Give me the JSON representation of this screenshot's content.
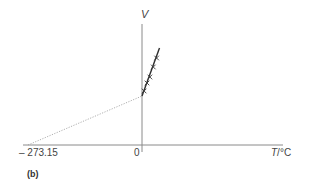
{
  "chart_data": {
    "type": "line",
    "title": "",
    "panel_label": "(b)",
    "xlabel": "T/°C",
    "xlabel_italic_part": "T",
    "xlabel_unit_part": "/°C",
    "ylabel": "V",
    "x_tick_labels": [
      "– 273.15",
      "0"
    ],
    "x_ticks": [
      -273.15,
      0
    ],
    "xlim": [
      -280,
      59
    ],
    "ylim": [
      0,
      121
    ],
    "y_units": "relative (no V tick labels shown; values are estimated pixel heights above the T axis)",
    "grid": false,
    "legend": null,
    "series": [
      {
        "name": "measured",
        "style": "solid",
        "markers": "x",
        "x": [
          0,
          42
        ],
        "y": [
          49,
          97
        ],
        "points": {
          "x": [
            5,
            12,
            19,
            27,
            35
          ],
          "y": [
            54,
            62,
            68,
            78,
            87
          ]
        }
      },
      {
        "name": "extrapolation",
        "style": "dotted",
        "markers": "none",
        "x": [
          -273.15,
          0
        ],
        "y": [
          0,
          49
        ]
      }
    ],
    "annotations": [
      "Dotted extrapolation of V vs T meets V = 0 at T = -273.15 °C"
    ]
  },
  "labels": {
    "v_axis": "V",
    "t_axis_italic": "T",
    "t_axis_unit": "/°C",
    "tick_left": "– 273.15",
    "tick_zero": "0",
    "panel": "(b)"
  },
  "colors": {
    "axis": "#8a8a8a",
    "line": "#2e2e2e",
    "dotted": "#9a9a9a",
    "marker": "#3a3a3a",
    "text": "#444444"
  }
}
